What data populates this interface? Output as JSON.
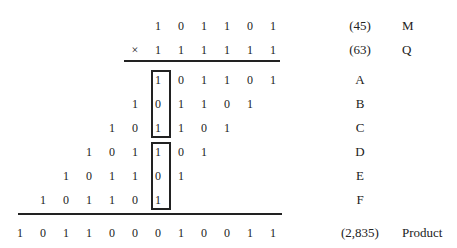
{
  "rows": [
    {
      "name": "M",
      "bits": [
        "1",
        "0",
        "1",
        "1",
        "0",
        "1"
      ],
      "start": 6,
      "decimal": "(45)",
      "label": "M"
    },
    {
      "name": "Q",
      "bits": [
        "×",
        "1",
        "1",
        "1",
        "1",
        "1",
        "1"
      ],
      "start": 5,
      "decimal": "(63)",
      "label": "Q"
    },
    {
      "name": "A",
      "bits": [
        "1",
        "0",
        "1",
        "1",
        "0",
        "1"
      ],
      "start": 6,
      "decimal": "A",
      "label": ""
    },
    {
      "name": "B",
      "bits": [
        "1",
        "0",
        "1",
        "1",
        "0",
        "1"
      ],
      "start": 5,
      "decimal": "B",
      "label": ""
    },
    {
      "name": "C",
      "bits": [
        "1",
        "0",
        "1",
        "1",
        "0",
        "1"
      ],
      "start": 4,
      "decimal": "C",
      "label": ""
    },
    {
      "name": "D",
      "bits": [
        "1",
        "0",
        "1",
        "1",
        "0",
        "1"
      ],
      "start": 3,
      "decimal": "D",
      "label": ""
    },
    {
      "name": "E",
      "bits": [
        "1",
        "0",
        "1",
        "1",
        "0",
        "1"
      ],
      "start": 2,
      "decimal": "E",
      "label": ""
    },
    {
      "name": "F",
      "bits": [
        "1",
        "0",
        "1",
        "1",
        "0",
        "1"
      ],
      "start": 1,
      "decimal": "F",
      "label": ""
    },
    {
      "name": "Product",
      "bits": [
        "1",
        "0",
        "1",
        "1",
        "0",
        "0",
        "0",
        "1",
        "0",
        "0",
        "1",
        "1"
      ],
      "start": 0,
      "decimal": "(2,835)",
      "label": "Product"
    }
  ]
}
